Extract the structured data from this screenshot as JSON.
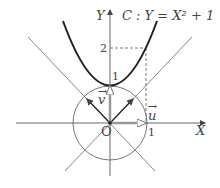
{
  "diagram": {
    "title": "C : Y = X² + 1",
    "axes": {
      "x_label": "X",
      "y_label": "Y",
      "origin_label": "O"
    },
    "ticks": {
      "x_one": "1",
      "y_one": "1",
      "y_two": "2"
    },
    "vectors": {
      "u": "u",
      "v": "v",
      "arrow": "→"
    },
    "colors": {
      "curve": "#222222",
      "lines": "#777777",
      "axis": "#555555"
    }
  }
}
